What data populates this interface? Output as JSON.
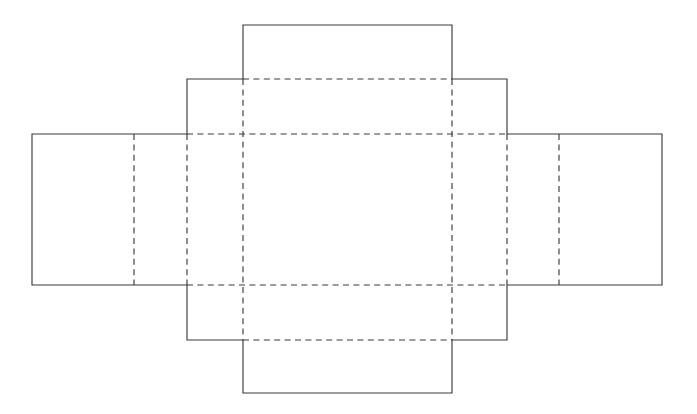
{
  "document": {
    "title": "Box Die-Cut Template",
    "type": "packaging-dieline-net",
    "description": "Flat unfolded net of a rectangular tray box with side walls, end walls and corner glue flaps",
    "canvas": {
      "width": 697,
      "height": 414,
      "background": "#ffffff"
    }
  },
  "style": {
    "cut_line_color": "#3b3b3b",
    "fold_line_color": "#3b3b3b",
    "line_width": 1.15,
    "fold_dash_pattern": "6 4.4",
    "fill_color": "#ffffff"
  },
  "legend": {
    "cut_line_label": "solid line = cut / outer edge",
    "fold_line_label": "dashed line = fold / score line"
  },
  "grid": {
    "x": {
      "x0": 32,
      "x1": 134,
      "x2": 187,
      "x3": 243,
      "x4": 452,
      "x5": 507,
      "x6": 559,
      "x7": 662
    },
    "y": {
      "y0": 25,
      "y1": 79,
      "y2": 134,
      "y3": 285,
      "y4": 340,
      "y5": 393
    }
  },
  "geometry": {
    "outline_path": "M 243 25 L 452 25 L 452 79 L 507 79 L 507 134 L 662 134 L 662 285 L 507 285 L 507 340 L 452 340 L 452 393 L 243 393 L 243 340 L 187 340 L 187 285 L 32 285 L 32 134 L 187 134 L 187 79 L 243 79 Z",
    "fold_lines": [
      {
        "name": "fold-main-top",
        "orientation": "horizontal",
        "d": "M 243 79 L 452 79"
      },
      {
        "name": "fold-main-bottom",
        "orientation": "horizontal",
        "d": "M 243 340 L 452 340"
      },
      {
        "name": "fold-face-top",
        "orientation": "horizontal",
        "d": "M 187 134 L 507 134"
      },
      {
        "name": "fold-face-bottom",
        "orientation": "horizontal",
        "d": "M 187 285 L 507 285"
      },
      {
        "name": "fold-face-left",
        "orientation": "vertical",
        "d": "M 243 79 L 243 340"
      },
      {
        "name": "fold-face-right",
        "orientation": "vertical",
        "d": "M 452 79 L 452 340"
      },
      {
        "name": "fold-left-wall",
        "orientation": "vertical",
        "d": "M 187 134 L 187 285"
      },
      {
        "name": "fold-right-wall",
        "orientation": "vertical",
        "d": "M 507 134 L 507 285"
      },
      {
        "name": "fold-left-flap",
        "orientation": "vertical",
        "d": "M 134 134 L 134 285"
      },
      {
        "name": "fold-right-flap",
        "orientation": "vertical",
        "d": "M 559 134 L 559 285"
      }
    ]
  },
  "panels": [
    {
      "id": "center-face",
      "name": "Center base panel",
      "role": "box bottom",
      "rect": {
        "x": 243,
        "y": 134,
        "width": 209,
        "height": 151
      }
    },
    {
      "id": "top-wall",
      "name": "Top end wall",
      "role": "side wall",
      "rect": {
        "x": 243,
        "y": 79,
        "width": 209,
        "height": 55
      }
    },
    {
      "id": "top-flap",
      "name": "Top outer flap",
      "role": "tuck flap",
      "rect": {
        "x": 243,
        "y": 25,
        "width": 209,
        "height": 54
      }
    },
    {
      "id": "bottom-wall",
      "name": "Bottom end wall",
      "role": "side wall",
      "rect": {
        "x": 243,
        "y": 285,
        "width": 209,
        "height": 55
      }
    },
    {
      "id": "bottom-flap",
      "name": "Bottom outer flap",
      "role": "tuck flap",
      "rect": {
        "x": 243,
        "y": 340,
        "width": 209,
        "height": 53
      }
    },
    {
      "id": "left-wall",
      "name": "Left side wall",
      "role": "side wall",
      "rect": {
        "x": 187,
        "y": 134,
        "width": 56,
        "height": 151
      }
    },
    {
      "id": "left-inner-flap",
      "name": "Left inner flap",
      "role": "glue flap",
      "rect": {
        "x": 134,
        "y": 134,
        "width": 53,
        "height": 151
      }
    },
    {
      "id": "left-outer-flap",
      "name": "Left outer flap",
      "role": "glue flap",
      "rect": {
        "x": 32,
        "y": 134,
        "width": 102,
        "height": 151
      }
    },
    {
      "id": "right-wall",
      "name": "Right side wall",
      "role": "side wall",
      "rect": {
        "x": 452,
        "y": 134,
        "width": 55,
        "height": 151
      }
    },
    {
      "id": "right-inner-flap",
      "name": "Right inner flap",
      "role": "glue flap",
      "rect": {
        "x": 507,
        "y": 134,
        "width": 52,
        "height": 151
      }
    },
    {
      "id": "right-outer-flap",
      "name": "Right outer flap",
      "role": "glue flap",
      "rect": {
        "x": 559,
        "y": 134,
        "width": 103,
        "height": 151
      }
    },
    {
      "id": "corner-top-left",
      "name": "Top-left corner flap",
      "role": "corner gusset",
      "rect": {
        "x": 187,
        "y": 79,
        "width": 56,
        "height": 55
      }
    },
    {
      "id": "corner-top-right",
      "name": "Top-right corner flap",
      "role": "corner gusset",
      "rect": {
        "x": 452,
        "y": 79,
        "width": 55,
        "height": 55
      }
    },
    {
      "id": "corner-bottom-left",
      "name": "Bottom-left corner flap",
      "role": "corner gusset",
      "rect": {
        "x": 187,
        "y": 285,
        "width": 56,
        "height": 55
      }
    },
    {
      "id": "corner-bottom-right",
      "name": "Bottom-right corner flap",
      "role": "corner gusset",
      "rect": {
        "x": 452,
        "y": 285,
        "width": 55,
        "height": 55
      }
    }
  ]
}
